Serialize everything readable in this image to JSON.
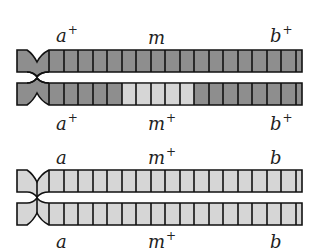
{
  "figure": {
    "colors": {
      "dark_band": "#8e8e8e",
      "light_band": "#d6d6d6",
      "outline": "#111111"
    },
    "top_pair": {
      "upper_labels": [
        {
          "gene": "a",
          "sup": "+"
        },
        {
          "gene": "m",
          "sup": ""
        },
        {
          "gene": "b",
          "sup": "+"
        }
      ],
      "lower_labels": [
        {
          "gene": "a",
          "sup": "+"
        },
        {
          "gene": "m",
          "sup": "+"
        },
        {
          "gene": "b",
          "sup": "+"
        }
      ],
      "upper_chromatid_fill": "dark",
      "lower_chromatid_fill": "dark",
      "lower_chromatid_light_cells": [
        6,
        7,
        8,
        9,
        10
      ]
    },
    "bottom_pair": {
      "upper_labels": [
        {
          "gene": "a",
          "sup": ""
        },
        {
          "gene": "m",
          "sup": "+"
        },
        {
          "gene": "b",
          "sup": ""
        }
      ],
      "lower_labels": [
        {
          "gene": "a",
          "sup": ""
        },
        {
          "gene": "m",
          "sup": "+"
        },
        {
          "gene": "b",
          "sup": ""
        }
      ],
      "upper_chromatid_fill": "light",
      "lower_chromatid_fill": "light"
    }
  }
}
